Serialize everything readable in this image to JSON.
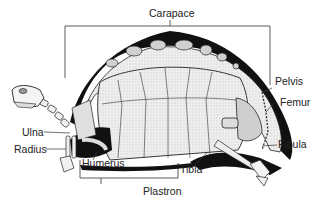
{
  "diagram": {
    "labels": {
      "carapace": "Carapace",
      "plastron": "Plastron",
      "pelvis": "Pelvis",
      "femur": "Femur",
      "fibula": "Fibula",
      "tibia": "Tibia",
      "humerus": "Humerus",
      "ulna": "Ulna",
      "radius": "Radius"
    },
    "colors": {
      "ink": "#1a1a1a",
      "shell_fill": "#e6e6e6",
      "background": "#ffffff"
    }
  }
}
